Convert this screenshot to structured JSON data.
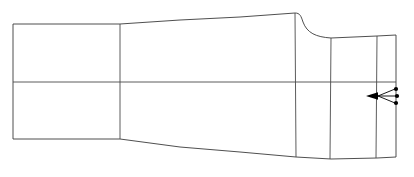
{
  "drawing": {
    "title": "Technical Wireframe Profile",
    "type": "line-drawing",
    "background_color": "#ffffff",
    "line_color": "#3b3b3b",
    "accent_color": "#000000",
    "canvas": {
      "width": 414,
      "height": 177
    },
    "outline": {
      "name": "body-outline",
      "path": "M 13,24 L 120,24 L 180,20 L 240,17 L 295,13 C 300,13 301,16 303,22 C 307,33 316,37 331,38 L 377,36 L 396,35 L 396,157 L 377,158 L 331,159 L 296,157 L 240,152 L 180,147 L 120,139 L 13,139 Z"
    },
    "construction_lines": [
      {
        "name": "waterline-centerline",
        "orientation": "horizontal",
        "path": "M 13,82 L 120,82 L 295,82 L 331,82 L 377,82 L 396,82"
      },
      {
        "name": "station-line-1",
        "orientation": "vertical",
        "path": "M 120,24 L 120,139"
      },
      {
        "name": "station-line-2",
        "orientation": "vertical",
        "path": "M 295,13 L 296,157"
      },
      {
        "name": "station-line-3",
        "orientation": "vertical",
        "path": "M 331,38 L 330,159"
      },
      {
        "name": "station-line-4",
        "orientation": "vertical",
        "path": "M 377,36 L 376,158"
      }
    ],
    "annotation": {
      "name": "leader-annotation",
      "arrow_tip": {
        "x": 367,
        "y": 96
      },
      "arrow_tail": {
        "x": 378,
        "y": 96
      },
      "leader_paths": [
        "M 378,96 L 395,89",
        "M 378,96 L 396,96",
        "M 378,96 L 395,103"
      ],
      "dots": [
        {
          "x": 396,
          "y": 89,
          "r": 2.1
        },
        {
          "x": 397,
          "y": 96,
          "r": 2.1
        },
        {
          "x": 396,
          "y": 103,
          "r": 2.1
        }
      ],
      "arrow_head_path": "M 366,96 L 378,92.3 L 378,99.7 Z"
    }
  }
}
